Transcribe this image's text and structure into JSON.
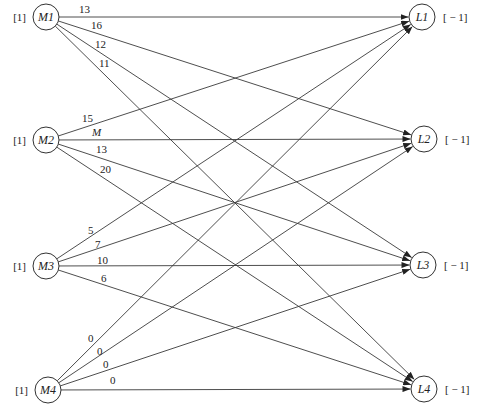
{
  "diagram": {
    "type": "bipartite-network",
    "sources": [
      {
        "id": "M1",
        "label": "M1",
        "supply": "[1]",
        "cx": 46,
        "cy": 17
      },
      {
        "id": "M2",
        "label": "M2",
        "supply": "[1]",
        "cx": 46,
        "cy": 140
      },
      {
        "id": "M3",
        "label": "M3",
        "supply": "[1]",
        "cx": 46,
        "cy": 266
      },
      {
        "id": "M4",
        "label": "M4",
        "supply": "[1]",
        "cx": 48,
        "cy": 390
      }
    ],
    "sinks": [
      {
        "id": "L1",
        "label": "L1",
        "demand": "[ − 1]",
        "cx": 422,
        "cy": 17
      },
      {
        "id": "L2",
        "label": "L2",
        "demand": "[ − 1]",
        "cx": 424,
        "cy": 139
      },
      {
        "id": "L3",
        "label": "L3",
        "demand": "[ − 1]",
        "cx": 423,
        "cy": 265
      },
      {
        "id": "L4",
        "label": "L4",
        "demand": "[ − 1]",
        "cx": 424,
        "cy": 389
      }
    ],
    "edges": [
      {
        "from": "M1",
        "to": "L1",
        "cost": "13",
        "lx": 79,
        "ly": 13
      },
      {
        "from": "M1",
        "to": "L2",
        "cost": "16",
        "lx": 91,
        "ly": 29
      },
      {
        "from": "M1",
        "to": "L3",
        "cost": "12",
        "lx": 95,
        "ly": 48
      },
      {
        "from": "M1",
        "to": "L4",
        "cost": "11",
        "lx": 99,
        "ly": 67
      },
      {
        "from": "M2",
        "to": "L1",
        "cost": "15",
        "lx": 82,
        "ly": 122
      },
      {
        "from": "M2",
        "to": "L2",
        "cost": "M",
        "lx": 92,
        "ly": 136,
        "italic": true
      },
      {
        "from": "M2",
        "to": "L3",
        "cost": "13",
        "lx": 96,
        "ly": 153
      },
      {
        "from": "M2",
        "to": "L4",
        "cost": "20",
        "lx": 100,
        "ly": 173
      },
      {
        "from": "M3",
        "to": "L1",
        "cost": "5",
        "lx": 88,
        "ly": 234
      },
      {
        "from": "M3",
        "to": "L2",
        "cost": "7",
        "lx": 95,
        "ly": 248
      },
      {
        "from": "M3",
        "to": "L3",
        "cost": "10",
        "lx": 97,
        "ly": 264
      },
      {
        "from": "M3",
        "to": "L4",
        "cost": "6",
        "lx": 101,
        "ly": 282
      },
      {
        "from": "M4",
        "to": "L1",
        "cost": "0",
        "lx": 88,
        "ly": 342
      },
      {
        "from": "M4",
        "to": "L2",
        "cost": "0",
        "lx": 97,
        "ly": 355
      },
      {
        "from": "M4",
        "to": "L3",
        "cost": "0",
        "lx": 103,
        "ly": 368
      },
      {
        "from": "M4",
        "to": "L4",
        "cost": "0",
        "lx": 110,
        "ly": 384
      }
    ],
    "node_radius": 13
  }
}
